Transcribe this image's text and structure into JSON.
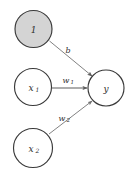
{
  "diagram": {
    "type": "neural-network-neuron",
    "background_color": "#ffffff",
    "node_stroke_color": "#3a3a3a",
    "edge_color": "#7b7b7b",
    "bias_node_fill": "#d4d4d4",
    "input_node_fill": "#ffffff",
    "output_node_fill": "#ffffff",
    "nodes": [
      {
        "id": "bias",
        "label": "1",
        "subscript": "",
        "cx": 33.5,
        "cy": 29,
        "r": 18.5,
        "filled": true,
        "role": "bias-node"
      },
      {
        "id": "x1",
        "label": "x",
        "subscript": "1",
        "cx": 33,
        "cy": 87,
        "r": 18.5,
        "filled": false,
        "role": "input-node"
      },
      {
        "id": "x2",
        "label": "x",
        "subscript": "2",
        "cx": 33,
        "cy": 148,
        "r": 19.5,
        "filled": false,
        "role": "input-node"
      },
      {
        "id": "y",
        "label": "y",
        "subscript": "",
        "cx": 106,
        "cy": 88,
        "r": 18,
        "filled": false,
        "role": "output-node"
      }
    ],
    "edges": [
      {
        "id": "edge-bias",
        "from": "bias",
        "to": "y",
        "label": "b",
        "subscript": "",
        "label_x": 68,
        "label_y": 50,
        "x1": 49.5,
        "y1": 41,
        "x2": 92,
        "y2": 76,
        "weight": "strong"
      },
      {
        "id": "edge-w1",
        "from": "x1",
        "to": "y",
        "label": "w",
        "subscript": "1",
        "label_x": 68,
        "label_y": 80,
        "x1": 52,
        "y1": 88,
        "x2": 87,
        "y2": 88,
        "weight": "strong"
      },
      {
        "id": "edge-w2",
        "from": "x2",
        "to": "y",
        "label": "w",
        "subscript": "2",
        "label_x": 64,
        "label_y": 118,
        "x1": 49,
        "y1": 134,
        "x2": 92,
        "y2": 101,
        "weight": "normal"
      }
    ]
  }
}
